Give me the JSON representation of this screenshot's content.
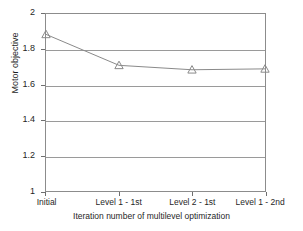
{
  "chart_data": {
    "type": "line",
    "title": "",
    "xlabel": "Iteration number of multilevel optimization",
    "ylabel": "Motor objective",
    "categories": [
      "Initial",
      "Level 1 - 1st",
      "Level 2 - 1st",
      "Level 1 - 2nd"
    ],
    "values": [
      1.885,
      1.71,
      1.685,
      1.69
    ],
    "series": [
      {
        "name": "Motor objective",
        "values": [
          1.885,
          1.71,
          1.685,
          1.69
        ],
        "marker": "triangle-up",
        "marker_filled": false,
        "line_color": "#8a8a8a",
        "marker_color": "#8a8a8a"
      }
    ],
    "ylim": [
      1,
      2
    ],
    "yticks": [
      "1",
      "1.2",
      "1.4",
      "1.6",
      "1.8",
      "2"
    ],
    "ytick_values": [
      1,
      1.2,
      1.4,
      1.6,
      1.8,
      2
    ],
    "grid": "horizontal",
    "grid_color": "#9a9a9a",
    "legend": "none",
    "frame_color": "#8c8c8c",
    "background": "#ffffff",
    "text_color": "#1f1f1f"
  }
}
